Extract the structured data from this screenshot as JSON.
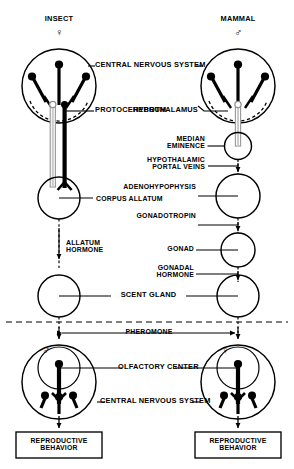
{
  "figure": {
    "type": "comparative-neuroendocrine-diagram",
    "columns": [
      {
        "id": "insect",
        "title": "INSECT",
        "sex_symbol": "♀",
        "sex": "female"
      },
      {
        "id": "mammal",
        "title": "MAMMAL",
        "sex_symbol": "♂",
        "sex": "male"
      }
    ],
    "labels": {
      "cns_top": "CENTRAL NERVOUS SYSTEM",
      "hypothalamus": "HYPOTHALAMUS",
      "protocerebrum": "PROTOCEREBRUM",
      "median_eminence": "MEDIAN\nEMINENCE",
      "portal_veins": "HYPOTHALAMIC\nPORTAL VEINS",
      "adenohypophysis": "ADENOHYPOPHYSIS",
      "corpus_allatum": "CORPUS ALLATUM",
      "gonadotropin": "GONADOTROPIN",
      "allatum_hormone": "ALLATUM\nHORMONE",
      "gonad": "GONAD",
      "gonadal_hormone": "GONADAL\nHORMONE",
      "scent_gland": "SCENT GLAND",
      "pheromone": "PHEROMONE",
      "olfactory_center": "OLFACTORY CENTER",
      "cns_bottom": "CENTRAL NERVOUS SYSTEM",
      "reproductive_behavior_left": "REPRODUCTIVE\nBEHAVIOR",
      "reproductive_behavior_right": "REPRODUCTIVE\nBEHAVIOR"
    },
    "receiver_symbols": {
      "left": "♂",
      "right": "♀"
    },
    "colors": {
      "ink": "#000000",
      "background": "#ffffff",
      "hollow_tract": "#b4b4b4"
    }
  }
}
